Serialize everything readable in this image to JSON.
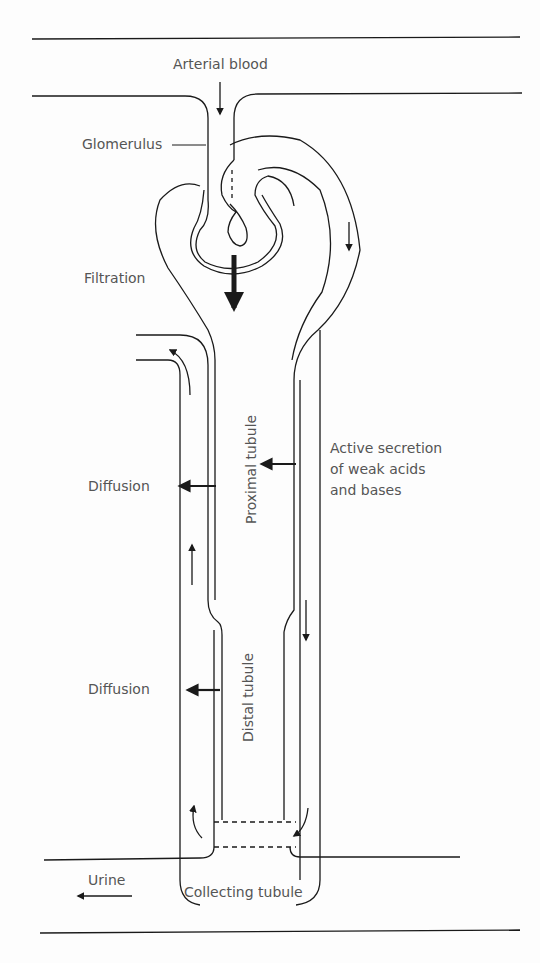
{
  "labels": {
    "arterial_blood": "Arterial blood",
    "glomerulus": "Glomerulus",
    "filtration": "Filtration",
    "proximal_tubule": "Proximal tubule",
    "active_secretion_1": "Active secretion",
    "active_secretion_2": "of weak acids",
    "active_secretion_3": "and bases",
    "diffusion_upper": "Diffusion",
    "diffusion_lower": "Diffusion",
    "distal_tubule": "Distal tubule",
    "urine": "Urine",
    "collecting_tubule": "Collecting tubule"
  },
  "colors": {
    "line": "#1a1a1a",
    "text": "#555555",
    "background": "#fdfdfd"
  }
}
